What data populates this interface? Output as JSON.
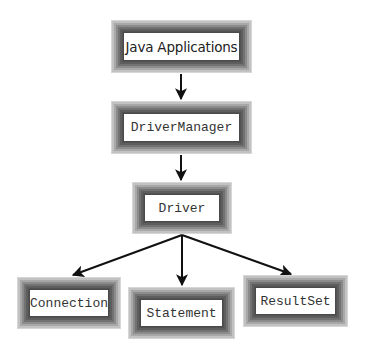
{
  "diagram": {
    "nodes": [
      {
        "id": "java-applications",
        "label": "Java Applications",
        "font": "sans",
        "x": 111,
        "y": 20,
        "w": 141,
        "h": 53
      },
      {
        "id": "driver-manager",
        "label": "DriverManager",
        "font": "mono",
        "x": 111,
        "y": 101,
        "w": 141,
        "h": 53
      },
      {
        "id": "driver",
        "label": "Driver",
        "font": "mono",
        "x": 132,
        "y": 182,
        "w": 100,
        "h": 52
      },
      {
        "id": "connection",
        "label": "Connection",
        "font": "mono",
        "x": 17,
        "y": 277,
        "w": 104,
        "h": 52
      },
      {
        "id": "statement",
        "label": "Statement",
        "font": "mono",
        "x": 128,
        "y": 287,
        "w": 107,
        "h": 52
      },
      {
        "id": "resultset",
        "label": "ResultSet",
        "font": "mono",
        "x": 243,
        "y": 275,
        "w": 105,
        "h": 52
      }
    ],
    "edges": [
      {
        "from": "java-applications",
        "to": "driver-manager"
      },
      {
        "from": "driver-manager",
        "to": "driver"
      },
      {
        "from": "driver",
        "to": "connection"
      },
      {
        "from": "driver",
        "to": "statement"
      },
      {
        "from": "driver",
        "to": "resultset"
      }
    ],
    "colors": {
      "arrow": "#111111",
      "frame_dark": "#525252",
      "frame_light": "#d6d6d6",
      "inner_fill": "#ffffff"
    }
  }
}
